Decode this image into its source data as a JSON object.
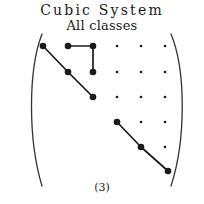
{
  "figure": {
    "title_main": "Cubic System",
    "title_sub": "All classes",
    "caption": "(3)",
    "ink_color": "#1a1a1a",
    "bracket_color": "#333333",
    "background": "#ffffff"
  },
  "chart_data": {
    "type": "scatter",
    "title": "Cubic System",
    "subtitle": "All classes",
    "annotations": [
      "(3)"
    ],
    "xlabel": "",
    "ylabel": "",
    "grid": false,
    "legend": "none",
    "axis_note": "6 x 6 lattice of points enclosed in large left and right parentheses",
    "columns_x": [
      43,
      68,
      93,
      117,
      141,
      165
    ],
    "rows_y": [
      46,
      72,
      97,
      122,
      147,
      171
    ],
    "points": [
      {
        "id": "p-r1c1",
        "row": 1,
        "col": 1,
        "x": 43,
        "y": 46,
        "size": "large",
        "value": 1
      },
      {
        "id": "p-r1c2",
        "row": 1,
        "col": 2,
        "x": 68,
        "y": 46,
        "size": "large",
        "value": 1
      },
      {
        "id": "p-r1c3",
        "row": 1,
        "col": 3,
        "x": 93,
        "y": 46,
        "size": "large",
        "value": 1
      },
      {
        "id": "p-r1c4",
        "row": 1,
        "col": 4,
        "x": 117,
        "y": 46,
        "size": "small",
        "value": 0
      },
      {
        "id": "p-r1c5",
        "row": 1,
        "col": 5,
        "x": 141,
        "y": 46,
        "size": "small",
        "value": 0
      },
      {
        "id": "p-r1c6",
        "row": 1,
        "col": 6,
        "x": 165,
        "y": 46,
        "size": "small",
        "value": 0
      },
      {
        "id": "p-r2c2",
        "row": 2,
        "col": 2,
        "x": 68,
        "y": 72,
        "size": "large",
        "value": 1
      },
      {
        "id": "p-r2c3",
        "row": 2,
        "col": 3,
        "x": 93,
        "y": 72,
        "size": "large",
        "value": 1
      },
      {
        "id": "p-r2c4",
        "row": 2,
        "col": 4,
        "x": 117,
        "y": 72,
        "size": "small",
        "value": 0
      },
      {
        "id": "p-r2c5",
        "row": 2,
        "col": 5,
        "x": 141,
        "y": 72,
        "size": "small",
        "value": 0
      },
      {
        "id": "p-r2c6",
        "row": 2,
        "col": 6,
        "x": 165,
        "y": 72,
        "size": "small",
        "value": 0
      },
      {
        "id": "p-r3c3",
        "row": 3,
        "col": 3,
        "x": 93,
        "y": 97,
        "size": "large",
        "value": 1
      },
      {
        "id": "p-r3c4",
        "row": 3,
        "col": 4,
        "x": 117,
        "y": 97,
        "size": "small",
        "value": 0
      },
      {
        "id": "p-r3c5",
        "row": 3,
        "col": 5,
        "x": 141,
        "y": 97,
        "size": "small",
        "value": 0
      },
      {
        "id": "p-r3c6",
        "row": 3,
        "col": 6,
        "x": 165,
        "y": 97,
        "size": "small",
        "value": 0
      },
      {
        "id": "p-r4c4",
        "row": 4,
        "col": 4,
        "x": 117,
        "y": 122,
        "size": "large",
        "value": 1
      },
      {
        "id": "p-r4c5",
        "row": 4,
        "col": 5,
        "x": 141,
        "y": 122,
        "size": "small",
        "value": 0
      },
      {
        "id": "p-r4c6",
        "row": 4,
        "col": 6,
        "x": 165,
        "y": 122,
        "size": "small",
        "value": 0
      },
      {
        "id": "p-r5c5",
        "row": 5,
        "col": 5,
        "x": 141,
        "y": 147,
        "size": "large",
        "value": 1
      },
      {
        "id": "p-r5c6",
        "row": 5,
        "col": 6,
        "x": 165,
        "y": 147,
        "size": "small",
        "value": 0
      },
      {
        "id": "p-r6c6",
        "row": 6,
        "col": 6,
        "x": 168,
        "y": 171,
        "size": "large",
        "value": 1
      }
    ],
    "connectors": [
      {
        "id": "edge-upper-diagonal-a",
        "from": "p-r1c1",
        "to": "p-r2c2",
        "x1": 43,
        "y1": 46,
        "x2": 68,
        "y2": 72
      },
      {
        "id": "edge-upper-diagonal-b",
        "from": "p-r2c2",
        "to": "p-r3c3",
        "x1": 68,
        "y1": 72,
        "x2": 93,
        "y2": 97
      },
      {
        "id": "edge-horizontal-top",
        "from": "p-r1c2",
        "to": "p-r1c3",
        "x1": 68,
        "y1": 46,
        "x2": 93,
        "y2": 46
      },
      {
        "id": "edge-vertical-right",
        "from": "p-r1c3",
        "to": "p-r2c3",
        "x1": 93,
        "y1": 46,
        "x2": 93,
        "y2": 72
      },
      {
        "id": "edge-lower-diagonal-a",
        "from": "p-r4c4",
        "to": "p-r5c5",
        "x1": 117,
        "y1": 122,
        "x2": 141,
        "y2": 147
      },
      {
        "id": "edge-lower-diagonal-b",
        "from": "p-r5c5",
        "to": "p-r6c6",
        "x1": 141,
        "y1": 147,
        "x2": 168,
        "y2": 171
      }
    ],
    "brackets": [
      {
        "id": "bracket-left",
        "side": "left",
        "path": "M 42 34 C 28 70, 28 140, 42 186"
      },
      {
        "id": "bracket-right",
        "side": "right",
        "path": "M 171 34 C 186 70, 186 140, 171 186"
      }
    ]
  }
}
